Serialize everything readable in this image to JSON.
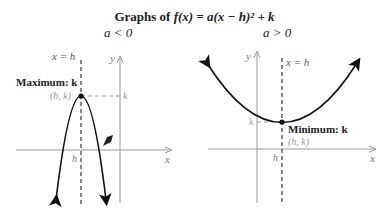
{
  "title": {
    "prefix": "Graphs of ",
    "formula": "f(x) = a(x − h)² + k"
  },
  "left_panel": {
    "condition": "a < 0",
    "asymptote_label": "x = h",
    "y_axis_label": "y",
    "x_axis_label": "x",
    "extremum_label": "Maximum: k",
    "vertex_label": "(h, k)",
    "k_tick_label": "k",
    "h_tick_label": "h",
    "opens": "down"
  },
  "right_panel": {
    "condition": "a > 0",
    "asymptote_label": "x = h",
    "y_axis_label": "y",
    "x_axis_label": "x",
    "extremum_label": "Minimum: k",
    "vertex_label": "(h, k)",
    "k_tick_label": "k",
    "h_tick_label": "h",
    "opens": "up"
  },
  "colors": {
    "curve": "#111111",
    "axis": "#9a9a9a",
    "dashed": "#444444",
    "faint_text": "#999999"
  }
}
